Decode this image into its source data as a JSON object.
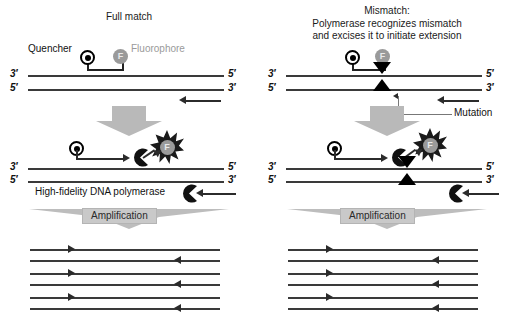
{
  "figure": {
    "type": "process-diagram"
  },
  "panels": [
    {
      "id": "full-match",
      "title": "Full match",
      "title_lines": [
        "Full match"
      ],
      "probe": {
        "quencher_label": "Quencher",
        "quencher_glyph": "Q",
        "fluorophore_label": "Fluorophore",
        "fluorophore_glyph": "F"
      },
      "duplex_top": {
        "left_end": "3′",
        "right_end": "5′"
      },
      "duplex_bottom": {
        "left_end": "5′",
        "right_end": "3′"
      },
      "stage2": {
        "quencher_glyph": "Q",
        "fluorophore_glyph": "F",
        "polymerase_label": "High-fidelity DNA polymerase",
        "duplex_top": {
          "left_end": "3′",
          "right_end": "5′"
        },
        "duplex_bottom": {
          "left_end": "5′",
          "right_end": "3′"
        }
      },
      "amplification_label": "Amplification",
      "products_count": 3
    },
    {
      "id": "mismatch",
      "title": "Mismatch:",
      "title_lines": [
        "Mismatch:",
        "Polymerase recognizes mismatch",
        "and excises it to initiate extension"
      ],
      "probe": {
        "quencher_glyph": "Q",
        "fluorophore_glyph": "F"
      },
      "duplex_top": {
        "left_end": "3′",
        "right_end": "5′"
      },
      "duplex_bottom": {
        "left_end": "5′",
        "right_end": "3′"
      },
      "mutation_label": "Mutation",
      "stage2": {
        "quencher_glyph": "Q",
        "fluorophore_glyph": "F",
        "duplex_top": {
          "left_end": "3′",
          "right_end": "5′"
        },
        "duplex_bottom": {
          "left_end": "5′",
          "right_end": "3′"
        }
      },
      "amplification_label": "Amplification",
      "products_count": 3
    }
  ],
  "colors": {
    "strand": "#3a3a3a",
    "arrow": "#2b2b2b",
    "quencher": "#000000",
    "fluorophore": "#9a9a9a",
    "block_arrow": "#b9b9b9",
    "amplification_band": "#c9c9c9",
    "leader": "#777777",
    "background": "#ffffff"
  }
}
